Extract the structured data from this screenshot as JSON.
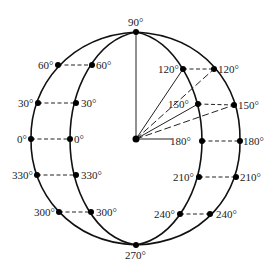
{
  "diagram": {
    "top_label": "90°",
    "bottom_label": "270°",
    "center_label": "",
    "left_outer": [
      {
        "label": "60°"
      },
      {
        "label": "30°"
      },
      {
        "label": "0°"
      },
      {
        "label": "330°"
      },
      {
        "label": "300°"
      }
    ],
    "left_inner": [
      {
        "label": "60°"
      },
      {
        "label": "30°"
      },
      {
        "label": "0°"
      },
      {
        "label": "330°"
      },
      {
        "label": "300°"
      }
    ],
    "right_inner": [
      {
        "label": "120°"
      },
      {
        "label": "150°"
      },
      {
        "label": "180°"
      },
      {
        "label": "210°"
      },
      {
        "label": "240°"
      }
    ],
    "right_outer": [
      {
        "label": "120°"
      },
      {
        "label": "150°"
      },
      {
        "label": "180°"
      },
      {
        "label": "210°"
      },
      {
        "label": "240°"
      }
    ],
    "colors": {
      "stroke": "#111111",
      "background": "#ffffff"
    }
  }
}
